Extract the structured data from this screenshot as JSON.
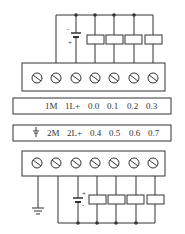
{
  "diagram": {
    "top_module": {
      "labels": [
        "1M",
        "1L+",
        "0.0",
        "0.1",
        "0.2",
        "0.3"
      ],
      "terminal_count": 7
    },
    "bottom_module": {
      "ground_symbol": "ground-icon",
      "labels": [
        "2M",
        "2L+",
        "0.4",
        "0.5",
        "0.6",
        "0.7"
      ],
      "terminal_count": 7
    },
    "colors": {
      "line": "#333333",
      "background": "#ffffff"
    }
  }
}
